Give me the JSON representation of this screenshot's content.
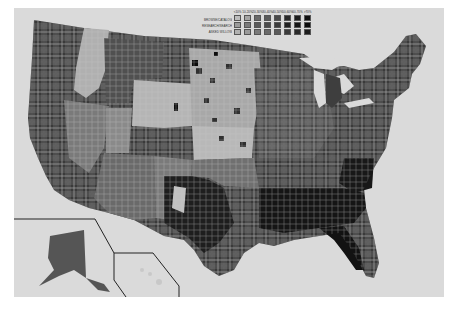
{
  "map": {
    "title": "",
    "type": "choropleth",
    "region": "United States counties",
    "insets": [
      "Alaska",
      "Hawaii"
    ],
    "colors": {
      "background": "#dadada",
      "water": "#dadada",
      "outside": "#ffffff",
      "inset_border": "#222222",
      "county_border": "#e8e8e8"
    }
  },
  "legend": {
    "row_labels": [
      "BROWSE/CATALOG",
      "RESEARCH/SEARCH",
      "ASKED WILLOW"
    ],
    "column_headers": [
      "<10%",
      "10-20%",
      "20-30%",
      "30-40%",
      "40-50%",
      "50-60%",
      "60-70%",
      ">70%"
    ],
    "swatches": [
      [
        "#bdbdbd",
        "#9a9a9a",
        "#b0b0b0"
      ],
      [
        "#a4a4a4",
        "#7a7a7a",
        "#9a9a9a"
      ],
      [
        "#6a6a6a",
        "#5a5a5a",
        "#7a7a7a"
      ],
      [
        "#5a5a5a",
        "#4a4a4a",
        "#6a6a6a"
      ],
      [
        "#4a4a4a",
        "#3a3a3a",
        "#5a5a5a"
      ],
      [
        "#2a2a2a",
        "#202020",
        "#3a3a3a"
      ],
      [
        "#1c1c1c",
        "#151515",
        "#2a2a2a"
      ],
      [
        "#101010",
        "#0a0a0a",
        "#1c1c1c"
      ]
    ]
  }
}
